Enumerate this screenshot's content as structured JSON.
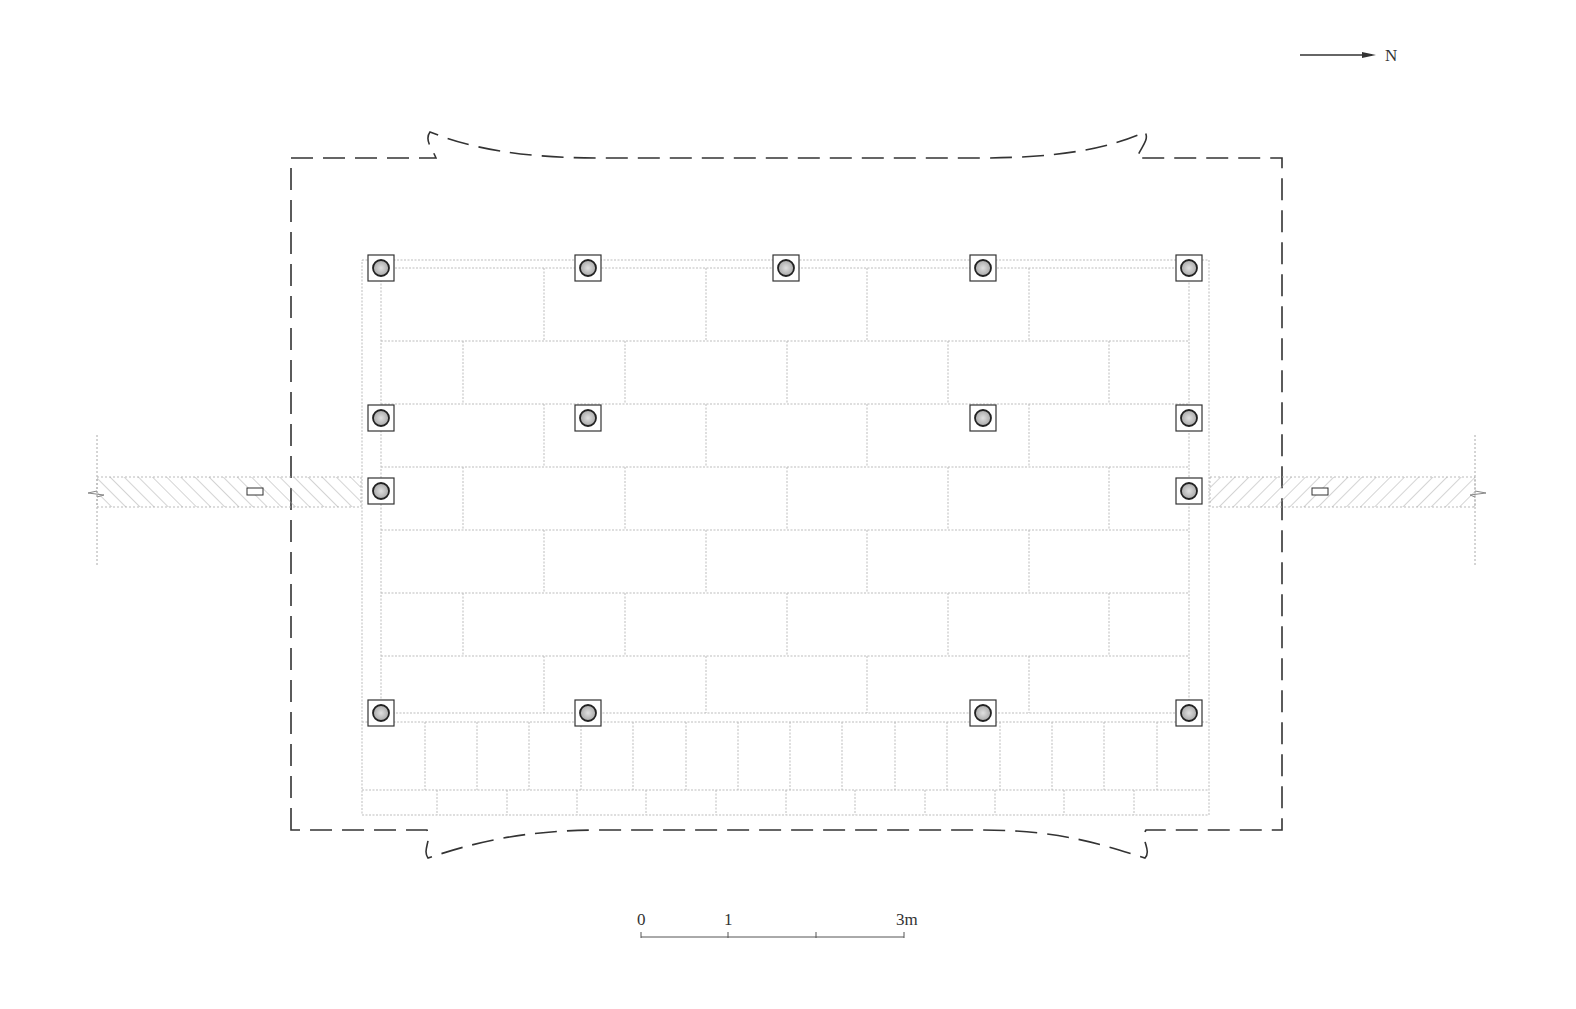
{
  "diagram": {
    "type": "architectural floor plan",
    "north_arrow": {
      "label": "N",
      "icon": "arrow-right-icon"
    },
    "scale_bar": {
      "labels": [
        "0",
        "1",
        "3m"
      ],
      "unit": "m"
    },
    "columns": {
      "rows": [
        {
          "y": 268,
          "x": [
            381,
            588,
            786,
            983,
            1189
          ]
        },
        {
          "y": 418,
          "x": [
            381,
            588,
            983,
            1189
          ]
        },
        {
          "y": 491,
          "x": [
            381,
            1189
          ]
        },
        {
          "y": 713,
          "x": [
            381,
            588,
            983,
            1189
          ]
        }
      ]
    },
    "colors": {
      "line": "#333333",
      "grid": "#b5b5b5",
      "column_fill": "#bdbdbd"
    }
  }
}
